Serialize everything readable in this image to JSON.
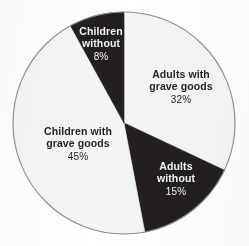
{
  "figure": {
    "background_color": "#ffffff",
    "geometry": {
      "center_x": 124,
      "center_y": 123,
      "radius": 111,
      "outline_color": "#8d9196"
    }
  },
  "chart_data": {
    "type": "pie",
    "title": "",
    "subtitle": "",
    "xlabel": "",
    "ylabel": "",
    "grid": false,
    "legend_position": "none",
    "labels_position": "inside-slices",
    "start_angle_deg": 0,
    "direction": "clockwise",
    "units": "percent",
    "total": 100,
    "categories": [
      "Adults with grave goods",
      "Adults without",
      "Children with grave goods",
      "Children without"
    ],
    "values": [
      32,
      15,
      45,
      8
    ],
    "slices": [
      {
        "name_line1": "Adults with",
        "name_line2": "grave goods",
        "label": "Adults with grave goods",
        "value": 32,
        "percent_text": "32%",
        "fill": "#f4f5f6",
        "text_color": "#231f20",
        "start_deg": 0,
        "end_deg": 115.2
      },
      {
        "name_line1": "Adults",
        "name_line2": "without",
        "label": "Adults without",
        "value": 15,
        "percent_text": "15%",
        "fill": "#231f20",
        "text_color": "#f2f3f5",
        "start_deg": 115.2,
        "end_deg": 169.2
      },
      {
        "name_line1": "Children with",
        "name_line2": "grave goods",
        "label": "Children with grave goods",
        "value": 45,
        "percent_text": "45%",
        "fill": "#f4f5f6",
        "text_color": "#231f20",
        "start_deg": 169.2,
        "end_deg": 331.2
      },
      {
        "name_line1": "Children",
        "name_line2": "without",
        "label": "Children without",
        "value": 8,
        "percent_text": "8%",
        "fill": "#231f20",
        "text_color": "#f2f3f5",
        "start_deg": 331.2,
        "end_deg": 360
      }
    ]
  }
}
